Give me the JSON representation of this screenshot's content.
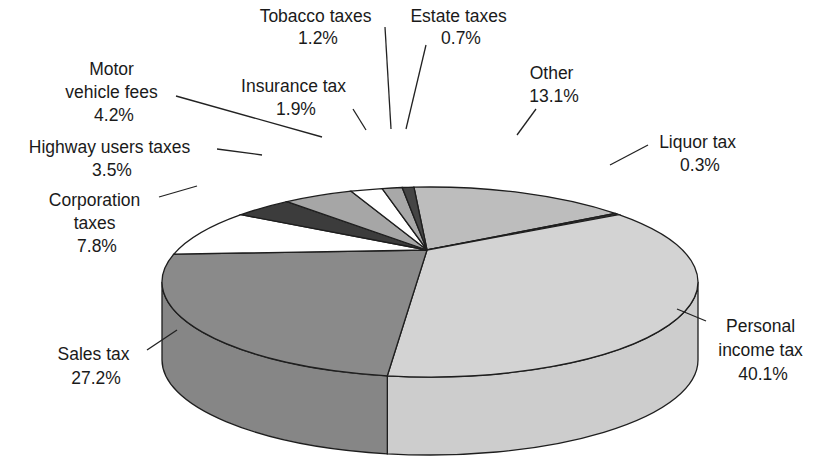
{
  "chart_data": {
    "type": "pie",
    "style": "3d",
    "title": "",
    "slices": [
      {
        "label": "Other",
        "value": 13.1,
        "value_label": "13.1%",
        "color": "#bdbdbd"
      },
      {
        "label": "Liquor tax",
        "value": 0.3,
        "value_label": "0.3%",
        "color": "#3a3a3a"
      },
      {
        "label": "Personal income tax",
        "value": 40.1,
        "value_label": "40.1%",
        "color": "#d3d3d3"
      },
      {
        "label": "Sales tax",
        "value": 27.2,
        "value_label": "27.2%",
        "color": "#8a8a8a"
      },
      {
        "label": "Corporation taxes",
        "value": 7.8,
        "value_label": "7.8%",
        "color": "#ffffff"
      },
      {
        "label": "Highway users taxes",
        "value": 3.5,
        "value_label": "3.5%",
        "color": "#3c3c3c"
      },
      {
        "label": "Motor vehicle fees",
        "value": 4.2,
        "value_label": "4.2%",
        "color": "#a6a6a6"
      },
      {
        "label": "Insurance tax",
        "value": 1.9,
        "value_label": "1.9%",
        "color": "#ffffff"
      },
      {
        "label": "Tobacco taxes",
        "value": 1.2,
        "value_label": "1.2%",
        "color": "#a8a8a8"
      },
      {
        "label": "Estate taxes",
        "value": 0.7,
        "value_label": "0.7%",
        "color": "#454545"
      }
    ],
    "legend": "none (direct labels with leader lines)"
  },
  "labels": {
    "tobacco": [
      "Tobacco taxes",
      "1.2%"
    ],
    "estate": [
      "Estate taxes",
      "0.7%"
    ],
    "motor": [
      "Motor",
      "vehicle fees",
      "4.2%"
    ],
    "insurance": [
      "Insurance tax",
      "1.9%"
    ],
    "other": [
      "Other",
      "13.1%"
    ],
    "liquor": [
      "Liquor tax",
      "0.3%"
    ],
    "highway": [
      "Highway users taxes",
      "3.5%"
    ],
    "corporation": [
      "Corporation",
      "taxes",
      "7.8%"
    ],
    "sales": [
      "Sales tax",
      "27.2%"
    ],
    "personal": [
      "Personal",
      "income tax",
      "40.1%"
    ]
  }
}
